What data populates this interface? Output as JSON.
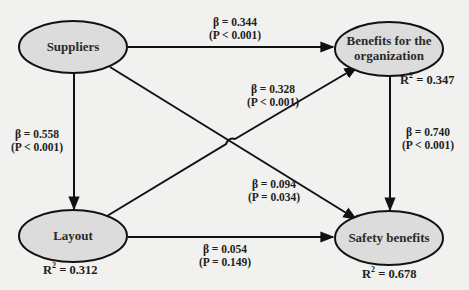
{
  "colors": {
    "background": "#f1f1ef",
    "node_fill": "#dcdcdc",
    "stroke": "#111111"
  },
  "nodes": {
    "suppliers": {
      "label": "Suppliers"
    },
    "benefits_org": {
      "line1": "Benefits for the",
      "line2": "organization",
      "r2_prefix": "R",
      "r2_sup": "2",
      "r2_value": " = 0.347"
    },
    "layout": {
      "label": "Layout",
      "r2_prefix": "R",
      "r2_sup": "2",
      "r2_value": " = 0.312"
    },
    "safety": {
      "label": "Safety benefits",
      "r2_prefix": "R",
      "r2_sup": "2",
      "r2_value": " = 0.678"
    }
  },
  "paths": {
    "suppliers_to_benefits": {
      "beta": "β = 0.344",
      "p": "(P < 0.001)"
    },
    "suppliers_to_layout": {
      "beta": "β = 0.558",
      "p": "(P < 0.001)"
    },
    "layout_to_benefits": {
      "beta": "β = 0.328",
      "p": "(P < 0.001)"
    },
    "benefits_to_safety": {
      "beta": "β = 0.740",
      "p": "(P < 0.001)"
    },
    "suppliers_to_safety": {
      "beta": "β = 0.094",
      "p": "(P = 0.034)"
    },
    "layout_to_safety": {
      "beta": "β = 0.054",
      "p": "(P = 0.149)"
    }
  }
}
